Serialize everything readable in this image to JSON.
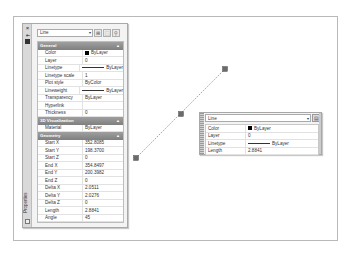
{
  "palette": {
    "title": "Properties",
    "close_icon": "×",
    "object_type": "Line",
    "toolbar_buttons": [
      {
        "name": "toggle-pickadd",
        "glyph": "⊞"
      },
      {
        "name": "select-objects",
        "glyph": "⬚"
      },
      {
        "name": "quick-select",
        "glyph": "⚲"
      }
    ],
    "sections": [
      {
        "label": "General",
        "rows": [
          {
            "key": "Color",
            "value": "ByLayer",
            "swatch": "#000000"
          },
          {
            "key": "Layer",
            "value": "0"
          },
          {
            "key": "Linetype",
            "value": "ByLayer",
            "line": true
          },
          {
            "key": "Linetype scale",
            "value": "1"
          },
          {
            "key": "Plot style",
            "value": "ByColor"
          },
          {
            "key": "Lineweight",
            "value": "ByLayer",
            "line": true
          },
          {
            "key": "Transparency",
            "value": "ByLayer"
          },
          {
            "key": "Hyperlink",
            "value": ""
          },
          {
            "key": "Thickness",
            "value": "0"
          }
        ]
      },
      {
        "label": "3D Visualization",
        "rows": [
          {
            "key": "Material",
            "value": "ByLayer"
          }
        ]
      },
      {
        "label": "Geometry",
        "rows": [
          {
            "key": "Start X",
            "value": "352.8085"
          },
          {
            "key": "Start Y",
            "value": "198.3700"
          },
          {
            "key": "Start Z",
            "value": "0"
          },
          {
            "key": "End X",
            "value": "354.8497"
          },
          {
            "key": "End Y",
            "value": "200.3982"
          },
          {
            "key": "End Z",
            "value": "0"
          },
          {
            "key": "Delta X",
            "value": "2.0511"
          },
          {
            "key": "Delta Y",
            "value": "2.0276"
          },
          {
            "key": "Delta Z",
            "value": "0"
          },
          {
            "key": "Length",
            "value": "2.8841"
          },
          {
            "key": "Angle",
            "value": "45"
          }
        ]
      }
    ]
  },
  "quick_properties": {
    "object_type": "Line",
    "rows": [
      {
        "key": "Color",
        "value": "ByLayer",
        "swatch": "#000000"
      },
      {
        "key": "Layer",
        "value": "0"
      },
      {
        "key": "Linetype",
        "value": "ByLayer",
        "line": true
      },
      {
        "key": "Length",
        "value": "2.8841"
      }
    ]
  },
  "drawing": {
    "line": {
      "x1": 136,
      "y1": 158,
      "x2": 225,
      "y2": 69
    },
    "grips": [
      {
        "name": "start",
        "x": 136,
        "y": 158
      },
      {
        "name": "midpoint",
        "x": 181,
        "y": 114
      },
      {
        "name": "end",
        "x": 225,
        "y": 69
      }
    ],
    "grip_color": "#6b6b6b"
  }
}
